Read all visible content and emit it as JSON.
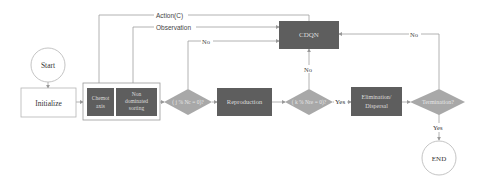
{
  "diagram": {
    "colors": {
      "process_fill": "#5e5e5e",
      "decision_fill": "#a8a8a8",
      "line": "#999999",
      "text_dark": "#333333",
      "text_light": "#e6e6e6"
    },
    "nodes": {
      "start": "Start",
      "initialize": "Initialize",
      "chemotaxis": [
        "Chemot",
        "axis"
      ],
      "non_dominated": [
        "Non",
        "dominated",
        "sorting"
      ],
      "decision1": "( j % Nc = 0)?",
      "reproduction": "Reproduction",
      "decision2": "( k % Nre = 0)?",
      "elimination": [
        "Elimination/",
        "Dispersal"
      ],
      "termination": "Termination?",
      "cdqn": "CDQN",
      "end": "END"
    },
    "edges": {
      "action": "Action(C)",
      "observation": "Observation",
      "no1": "No",
      "no2": "No",
      "yes2": "Yes",
      "no3": "No",
      "yes3": "Yes"
    }
  }
}
